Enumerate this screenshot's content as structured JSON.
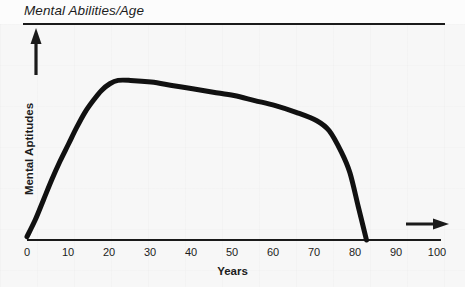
{
  "title": "Mental Abilities/Age",
  "chart_data": {
    "type": "line",
    "title": "Mental Abilities/Age",
    "xlabel": "Years",
    "ylabel": "Mental Aptitudes",
    "xlim": [
      0,
      100
    ],
    "ylim": [
      0,
      100
    ],
    "grid": false,
    "legend": "none",
    "x_ticks": [
      "0",
      "10",
      "20",
      "30",
      "40",
      "50",
      "60",
      "70",
      "80",
      "90",
      "100"
    ],
    "x_tick_values": [
      0,
      10,
      20,
      30,
      40,
      50,
      60,
      70,
      80,
      90,
      100
    ],
    "y_ticks": [],
    "series": [
      {
        "name": "Mental Aptitudes",
        "x": [
          0,
          2,
          4,
          6,
          8,
          10,
          12,
          14,
          16,
          18,
          20,
          22,
          25,
          30,
          35,
          40,
          45,
          50,
          55,
          60,
          65,
          70,
          73,
          76,
          78,
          80,
          81,
          82
        ],
        "values": [
          2,
          12,
          24,
          36,
          47,
          57,
          67,
          76,
          83,
          89,
          93,
          95,
          95,
          94,
          92,
          90,
          88,
          86,
          83,
          80,
          76,
          71,
          65,
          52,
          40,
          20,
          10,
          0
        ]
      }
    ],
    "annotations": [
      {
        "name": "y-axis-arrow",
        "direction": "up",
        "x": 0,
        "y": 100
      },
      {
        "name": "x-axis-arrow",
        "direction": "right",
        "x": 98,
        "y": 8
      }
    ],
    "curve_color": "#111111",
    "axis_color": "#1a1a1a",
    "background_color": "#f7f7f7"
  },
  "icons": {
    "y_axis_arrow": "arrow-up-icon",
    "x_axis_arrow": "arrow-right-icon"
  }
}
